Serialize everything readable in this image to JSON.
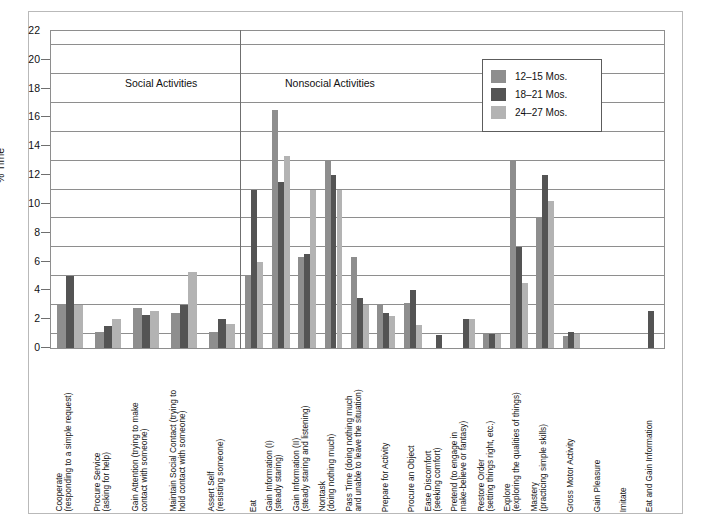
{
  "figure": {
    "ylabel": "% Time",
    "sections": [
      {
        "name": "Social Activities"
      },
      {
        "name": "Nonsocial Activities"
      }
    ]
  },
  "legend": {
    "position": "top-right-inside",
    "entries": [
      {
        "label": "12–15 Mos.",
        "color": "#8e8e8e"
      },
      {
        "label": "18–21 Mos.",
        "color": "#545454"
      },
      {
        "label": "24–27 Mos.",
        "color": "#b3b3b3"
      }
    ]
  },
  "chart_data": {
    "type": "bar",
    "title": "",
    "xlabel": "",
    "ylabel": "% Time",
    "ylim": [
      0,
      22
    ],
    "yticks": [
      0,
      2,
      4,
      6,
      8,
      10,
      12,
      14,
      16,
      18,
      20,
      22
    ],
    "gridlines": [
      1,
      3,
      5,
      7,
      9,
      11,
      13,
      15,
      17,
      19,
      21
    ],
    "grid": true,
    "legend_position": "upper right",
    "series": [
      {
        "name": "12–15 Mos.",
        "color": "#8e8e8e",
        "values": [
          3.0,
          1.1,
          2.8,
          2.4,
          1.1,
          5.0,
          16.5,
          6.3,
          13.0,
          6.3,
          3.0,
          3.1,
          0.0,
          0.0,
          1.0,
          13.0,
          9.0,
          0.8,
          0.0,
          0.0,
          0.0
        ]
      },
      {
        "name": "18–21 Mos.",
        "color": "#545454",
        "values": [
          5.0,
          1.5,
          2.3,
          3.0,
          2.0,
          11.0,
          11.5,
          6.5,
          12.0,
          3.5,
          2.4,
          4.0,
          0.9,
          2.0,
          1.0,
          7.0,
          12.0,
          1.1,
          0.0,
          0.0,
          2.6
        ]
      },
      {
        "name": "24–27 Mos.",
        "color": "#b3b3b3",
        "values": [
          3.0,
          2.0,
          2.6,
          5.3,
          1.7,
          6.0,
          13.3,
          11.0,
          11.0,
          3.0,
          2.2,
          1.6,
          0.0,
          2.0,
          1.0,
          4.5,
          10.2,
          1.0,
          0.0,
          0.0,
          0.0
        ]
      }
    ],
    "categories": [
      {
        "line1": "Cooperate",
        "line2": "(responding to a simple request)",
        "section": "Social Activities"
      },
      {
        "line1": "Procure Service",
        "line2": "(asking for help)",
        "section": "Social Activities"
      },
      {
        "line1": "Gain Attention (trying to make",
        "line2": "contact with someone)",
        "section": "Social Activities"
      },
      {
        "line1": "Maintain Social Contact (trying to",
        "line2": "hold contact with someone)",
        "section": "Social Activities"
      },
      {
        "line1": "Assert Self",
        "line2": "(resisting someone)",
        "section": "Social Activities"
      },
      {
        "line1": "Eat",
        "line2": "",
        "section": "Nonsocial Activities"
      },
      {
        "line1": "Gain Information (I)",
        "line2": "(steady staring)",
        "section": "Nonsocial Activities"
      },
      {
        "line1": "Gain Information (II)",
        "line2": "(steady staring and listening)",
        "section": "Nonsocial Activities"
      },
      {
        "line1": "Nontask",
        "line2": "(doing nothing much)",
        "section": "Nonsocial Activities"
      },
      {
        "line1": "Pass Time (doing nothing much",
        "line2": "and unable to leave the situation)",
        "section": "Nonsocial Activities"
      },
      {
        "line1": "Prepare for Activity",
        "line2": "",
        "section": "Nonsocial Activities"
      },
      {
        "line1": "Procure an Object",
        "line2": "",
        "section": "Nonsocial Activities"
      },
      {
        "line1": "Ease Discomfort",
        "line2": "(seeking comfort)",
        "section": "Nonsocial Activities"
      },
      {
        "line1": "Pretend (to engage in",
        "line2": "make-believe or fantasy)",
        "section": "Nonsocial Activities"
      },
      {
        "line1": "Restore Order",
        "line2": "(setting things right, etc.)",
        "section": "Nonsocial Activities"
      },
      {
        "line1": "Explore",
        "line2": "(exploring the qualities of things)",
        "section": "Nonsocial Activities"
      },
      {
        "line1": "Mastery",
        "line2": "(practicing simple skills)",
        "section": "Nonsocial Activities"
      },
      {
        "line1": "Gross Motor Activity",
        "line2": "",
        "section": "Nonsocial Activities"
      },
      {
        "line1": "Gain Pleasure",
        "line2": "",
        "section": "Nonsocial Activities"
      },
      {
        "line1": "Imitate",
        "line2": "",
        "section": "Nonsocial Activities"
      },
      {
        "line1": "Eat and Gain Information",
        "line2": "",
        "section": "Nonsocial Activities"
      }
    ]
  }
}
